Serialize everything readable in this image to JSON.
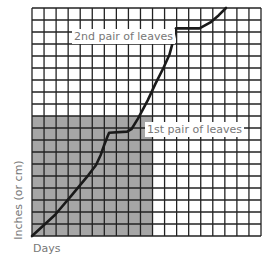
{
  "chart_data": {
    "type": "line",
    "title": "",
    "xlabel": "Days",
    "ylabel": "Inches (or cm)",
    "grid": true,
    "grid_cells": {
      "columns": 19,
      "rows": 19
    },
    "xlim": [
      0,
      19
    ],
    "ylim": [
      0,
      19
    ],
    "shaded_region": {
      "x": [
        0,
        10
      ],
      "y": [
        0,
        10
      ],
      "color": "#a6a6a6"
    },
    "series": [
      {
        "name": "plant height",
        "x": [
          0,
          1.9,
          3.3,
          4.7,
          5.3,
          5.7,
          6.0,
          6.25,
          6.4,
          7.9,
          8.25,
          8.8,
          9.6,
          10.25,
          10.9,
          11.4,
          11.75,
          11.85,
          11.95,
          13.9,
          14.8,
          15.5,
          16.1
        ],
        "values": [
          0,
          1.75,
          3.4,
          5.1,
          5.9,
          6.75,
          7.6,
          8.25,
          8.6,
          8.7,
          8.9,
          9.8,
          11.3,
          12.7,
          14.0,
          15.1,
          16.4,
          16.9,
          17.3,
          17.3,
          17.8,
          18.4,
          19
        ]
      }
    ],
    "annotations": [
      {
        "text": "1st pair of leaves",
        "x": 9.3,
        "y": 9.4
      },
      {
        "text": "2nd pair of leaves",
        "x": 3.4,
        "y": 17.2
      }
    ],
    "line_color": "#1a1a1a",
    "grid_color": "#222222"
  },
  "labels": {
    "ylabel": "Inches (or cm)",
    "xlabel": "Days",
    "ann1": "1st pair of leaves",
    "ann2": "2nd pair of leaves"
  }
}
